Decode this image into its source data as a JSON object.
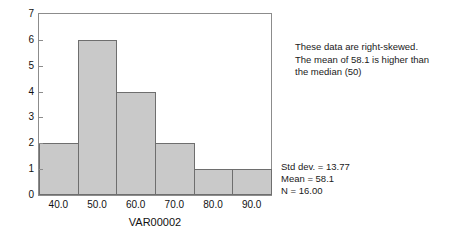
{
  "chart_data": {
    "type": "bar",
    "title": "",
    "subtitle": "",
    "xlabel": "VAR00002",
    "ylabel": "",
    "categories": [
      "40.0",
      "50.0",
      "60.0",
      "70.0",
      "80.0",
      "90.0"
    ],
    "bin_centers": [
      40.0,
      50.0,
      60.0,
      70.0,
      80.0,
      90.0
    ],
    "bin_width": 10,
    "values": [
      2,
      6,
      4,
      2,
      1,
      1
    ],
    "xlim": [
      35,
      95
    ],
    "ylim": [
      0,
      7
    ],
    "x_tick_labels": [
      "40.0",
      "50.0",
      "60.0",
      "70.0",
      "80.0",
      "90.0"
    ],
    "y_tick_labels": [
      "0",
      "1",
      "2",
      "3",
      "4",
      "5",
      "6",
      "7"
    ],
    "y_ticks": [
      0,
      1,
      2,
      3,
      4,
      5,
      6,
      7
    ],
    "grid": false,
    "legend": false,
    "legend_position": "none",
    "bar_fill_color": "#c9c9c9",
    "bar_edge_color": "#6e6e6e",
    "frame_color": "#8c8c8c",
    "background_color": "#ffffff",
    "annotations": [
      "These data are right-skewed.",
      "The mean of 58.1 is higher than",
      "the median (50)"
    ],
    "statistics": [
      "Std dev. = 13.77",
      "Mean = 58.1",
      "N = 16.00"
    ]
  },
  "annotation": {
    "line_1": "These data are right-skewed.",
    "line_2": "The mean of 58.1 is higher than",
    "line_3": "the median (50)"
  },
  "stats": {
    "std_dev": "Std dev. = 13.77",
    "mean": "Mean = 58.1",
    "n": "N = 16.00"
  },
  "axes": {
    "x_title": "VAR00002"
  }
}
